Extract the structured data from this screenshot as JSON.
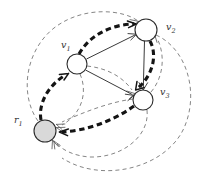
{
  "figure": {
    "width": 207,
    "height": 191,
    "background": "#ffffff"
  },
  "colors": {
    "node_stroke": "#2b2b2b",
    "node_open_fill": "#ffffff",
    "node_shaded_fill": "#d9d9d9",
    "solid_edge": "#3a3a3a",
    "thin_dashed_edge": "#6f6f6f",
    "thick_dashed_edge": "#141414",
    "label_text": "#333333"
  },
  "nodes": [
    {
      "id": "v1",
      "label_base": "v",
      "label_sub": "1",
      "cx": 77,
      "cy": 64,
      "r": 10,
      "fill_style": "open",
      "label_x": 61,
      "label_y": 48
    },
    {
      "id": "v2",
      "label_base": "v",
      "label_sub": "2",
      "cx": 146,
      "cy": 30,
      "r": 11,
      "fill_style": "open",
      "label_x": 166,
      "label_y": 30
    },
    {
      "id": "v3",
      "label_base": "v",
      "label_sub": "3",
      "cx": 143,
      "cy": 100,
      "r": 10,
      "fill_style": "open",
      "label_x": 160,
      "label_y": 95
    },
    {
      "id": "r1",
      "label_base": "r",
      "label_sub": "1",
      "cx": 45,
      "cy": 131,
      "r": 11,
      "fill_style": "shaded",
      "label_x": 14,
      "label_y": 123
    }
  ],
  "edges": [
    {
      "id": "v1-v2-solid",
      "from": "v1",
      "to": "v2",
      "style": "solid",
      "arrow": true
    },
    {
      "id": "v1-v3-solid",
      "from": "v1",
      "to": "v3",
      "style": "solid",
      "arrow": true
    },
    {
      "id": "v2-v3-solid",
      "from": "v2",
      "to": "v3",
      "style": "solid",
      "arrow": true
    },
    {
      "id": "v1-v2-thick",
      "from": "v1",
      "to": "v2",
      "style": "thick-dashed",
      "arrow": true
    },
    {
      "id": "v2-v3-thick",
      "from": "v2",
      "to": "v3",
      "style": "thick-dashed",
      "arrow": true
    },
    {
      "id": "v3-r1-thick",
      "from": "v3",
      "to": "r1",
      "style": "thick-dashed",
      "arrow": true
    },
    {
      "id": "r1-v1-thick",
      "from": "r1",
      "to": "v1",
      "style": "thick-dashed",
      "arrow": true
    },
    {
      "id": "v1-r1-thin",
      "from": "v1",
      "to": "r1",
      "style": "thin-dashed",
      "arrow": true
    },
    {
      "id": "v1-v3-thin",
      "from": "v1",
      "to": "v3",
      "style": "thin-dashed",
      "arrow": true
    },
    {
      "id": "v3-r1-thin",
      "from": "v3",
      "to": "r1",
      "style": "thin-dashed",
      "arrow": true
    },
    {
      "id": "v3-v2-thin",
      "from": "v3",
      "to": "v2",
      "style": "thin-dashed",
      "arrow": true
    },
    {
      "id": "r1-v2-thin-outer",
      "from": "r1",
      "to": "v2",
      "style": "thin-dashed",
      "arrow": true
    },
    {
      "id": "v2-r1-thin-outer",
      "from": "v2",
      "to": "r1",
      "style": "thin-dashed",
      "arrow": true
    },
    {
      "id": "v3-r1-thin-outer",
      "from": "v3",
      "to": "r1",
      "style": "thin-dashed",
      "arrow": true
    }
  ]
}
